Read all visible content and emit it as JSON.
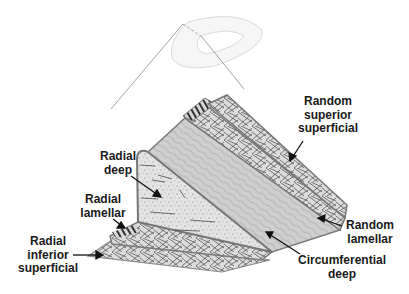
{
  "diagram": {
    "inset_icon": "meniscus-outline-icon",
    "colors": {
      "background": "#ffffff",
      "layer_fill": "#d4d4d4",
      "layer_edge": "#7a7a7a",
      "fiber": "#2b2b2b",
      "label_text": "#1a1a1a",
      "arrow": "#111111"
    },
    "labels": [
      {
        "id": "random-superior-superficial",
        "lines": [
          "Random",
          "superior",
          "superficial"
        ]
      },
      {
        "id": "radial-deep",
        "lines": [
          "Radial",
          "deep"
        ]
      },
      {
        "id": "radial-lamellar",
        "lines": [
          "Radial",
          "lamellar"
        ]
      },
      {
        "id": "radial-inferior-superficial",
        "lines": [
          "Radial",
          "inferior",
          "superficial"
        ]
      },
      {
        "id": "random-lamellar",
        "lines": [
          "Random",
          "lamellar"
        ]
      },
      {
        "id": "circumferential-deep",
        "lines": [
          "Circumferential",
          "deep"
        ]
      }
    ]
  }
}
